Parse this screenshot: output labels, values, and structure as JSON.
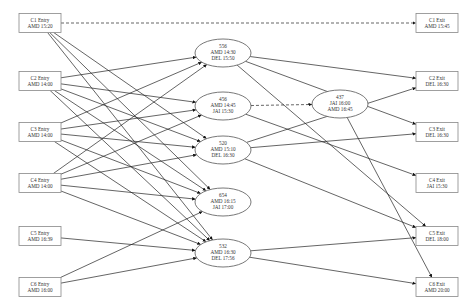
{
  "diagram": {
    "type": "directed-flow-graph",
    "entries": [
      {
        "id": "c1e",
        "line1": "C1 Entry",
        "line2": "AMD 15:20",
        "x": 40,
        "y": 23
      },
      {
        "id": "c2e",
        "line1": "C2 Entry",
        "line2": "AMD 14:00",
        "x": 40,
        "y": 81
      },
      {
        "id": "c3e",
        "line1": "C3 Entry",
        "line2": "AMD 14:00",
        "x": 40,
        "y": 132
      },
      {
        "id": "c4e",
        "line1": "C4 Entry",
        "line2": "AMD 14:00",
        "x": 40,
        "y": 183
      },
      {
        "id": "c5e",
        "line1": "C5 Entry",
        "line2": "AMD 16:39",
        "x": 40,
        "y": 236
      },
      {
        "id": "c6e",
        "line1": "C6 Entry",
        "line2": "AMD 16:00",
        "x": 40,
        "y": 287
      }
    ],
    "flights": [
      {
        "id": "f556",
        "line1": "556",
        "line2": "AMD 14:30",
        "line3": "DEL 15:50",
        "x": 223,
        "y": 53
      },
      {
        "id": "f456",
        "line1": "456",
        "line2": "AMD 14:45",
        "line3": "JAI 15:30",
        "x": 223,
        "y": 106
      },
      {
        "id": "f520",
        "line1": "520",
        "line2": "AMD 15:10",
        "line3": "DEL 16:30",
        "x": 223,
        "y": 150
      },
      {
        "id": "f654",
        "line1": "654",
        "line2": "AMD 16:15",
        "line3": "JAI 17:00",
        "x": 223,
        "y": 202
      },
      {
        "id": "f532",
        "line1": "532",
        "line2": "AMD 16:30",
        "line3": "DEL 17:56",
        "x": 223,
        "y": 253
      },
      {
        "id": "f437",
        "line1": "437",
        "line2": "JAI 16:00",
        "line3": "AMD 16:45",
        "x": 340,
        "y": 104
      }
    ],
    "exits": [
      {
        "id": "c1x",
        "line1": "C1 Exit",
        "line2": "AMD 15:45",
        "x": 437,
        "y": 23
      },
      {
        "id": "c2x",
        "line1": "C2 Exit",
        "line2": "DEL 16:30",
        "x": 437,
        "y": 81
      },
      {
        "id": "c3x",
        "line1": "C3 Exit",
        "line2": "DEL 16:30",
        "x": 437,
        "y": 132
      },
      {
        "id": "c4x",
        "line1": "C4 Exit",
        "line2": "JAI 15:30",
        "x": 437,
        "y": 183
      },
      {
        "id": "c5x",
        "line1": "C5 Exit",
        "line2": "DEL 18:00",
        "x": 437,
        "y": 236
      },
      {
        "id": "c6x",
        "line1": "C6 Exit",
        "line2": "AMD 20:00",
        "x": 437,
        "y": 287
      }
    ],
    "edges": [
      {
        "from": "c1e",
        "to": "c1x",
        "style": "dashed"
      },
      {
        "from": "c1e",
        "to": "f654"
      },
      {
        "from": "c1e",
        "to": "f532"
      },
      {
        "from": "c1e",
        "to": "f520"
      },
      {
        "from": "c2e",
        "to": "f556"
      },
      {
        "from": "c2e",
        "to": "f456"
      },
      {
        "from": "c2e",
        "to": "f520"
      },
      {
        "from": "c2e",
        "to": "f654"
      },
      {
        "from": "c2e",
        "to": "f532"
      },
      {
        "from": "c3e",
        "to": "f556"
      },
      {
        "from": "c3e",
        "to": "f456"
      },
      {
        "from": "c3e",
        "to": "f520"
      },
      {
        "from": "c3e",
        "to": "f654"
      },
      {
        "from": "c3e",
        "to": "f532"
      },
      {
        "from": "c4e",
        "to": "f556"
      },
      {
        "from": "c4e",
        "to": "f456"
      },
      {
        "from": "c4e",
        "to": "f520"
      },
      {
        "from": "c4e",
        "to": "f654"
      },
      {
        "from": "c4e",
        "to": "f532"
      },
      {
        "from": "c5e",
        "to": "f532"
      },
      {
        "from": "c6e",
        "to": "f654"
      },
      {
        "from": "c6e",
        "to": "f532"
      },
      {
        "from": "f456",
        "to": "f437",
        "style": "dashed"
      },
      {
        "from": "f556",
        "to": "c2x"
      },
      {
        "from": "f556",
        "to": "c3x"
      },
      {
        "from": "f556",
        "to": "c5x"
      },
      {
        "from": "f456",
        "to": "c4x"
      },
      {
        "from": "f520",
        "to": "c2x"
      },
      {
        "from": "f520",
        "to": "c3x"
      },
      {
        "from": "f520",
        "to": "c5x"
      },
      {
        "from": "f437",
        "to": "c6x"
      },
      {
        "from": "f532",
        "to": "c5x"
      },
      {
        "from": "f532",
        "to": "c6x"
      }
    ]
  }
}
